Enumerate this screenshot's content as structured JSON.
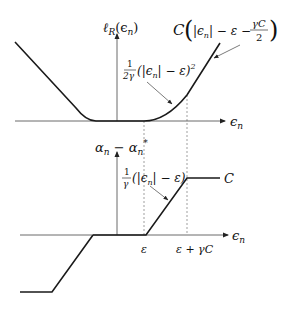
{
  "figure": {
    "top_plot": {
      "y_axis_label": "ℓ_R(ϵ_n)",
      "y_axis_label_main": "ℓ",
      "y_axis_label_sub": "R",
      "y_axis_label_arg": "(ϵ",
      "y_axis_label_arg_sub": "n",
      "y_axis_label_close": ")",
      "x_axis_label": "ϵ",
      "x_axis_label_sub": "n",
      "annotation_linear": {
        "prefix": "C",
        "body": "|ϵ",
        "sub": "n",
        "rest": "| − ε − ",
        "frac_num": "γC",
        "frac_den": "2"
      },
      "annotation_quadratic": {
        "frac_num": "1",
        "frac_den": "2γ",
        "body": "(|ϵ",
        "sub": "n",
        "rest": "| − ε)",
        "sup": "2"
      }
    },
    "bottom_plot": {
      "y_axis_label": "α_n − α_n*",
      "y_axis_label_a": "α",
      "y_axis_label_a_sub": "n",
      "y_axis_label_minus": " − ",
      "y_axis_label_b": "α",
      "y_axis_label_b_sub": "n",
      "y_axis_label_b_sup": "*",
      "x_axis_label": "ϵ",
      "x_axis_label_sub": "n",
      "annotation_ramp": {
        "frac_num": "1",
        "frac_den": "γ",
        "body": "(|ϵ",
        "sub": "n",
        "rest": "| − ε)"
      },
      "plateau_label": "C",
      "tick_epsilon": "ε",
      "tick_epsilon_gamma_c": "ε + γC"
    },
    "colors": {
      "curve": "#1a1a1a",
      "axis": "#444444",
      "dashed": "#666666",
      "background": "#ffffff"
    }
  }
}
